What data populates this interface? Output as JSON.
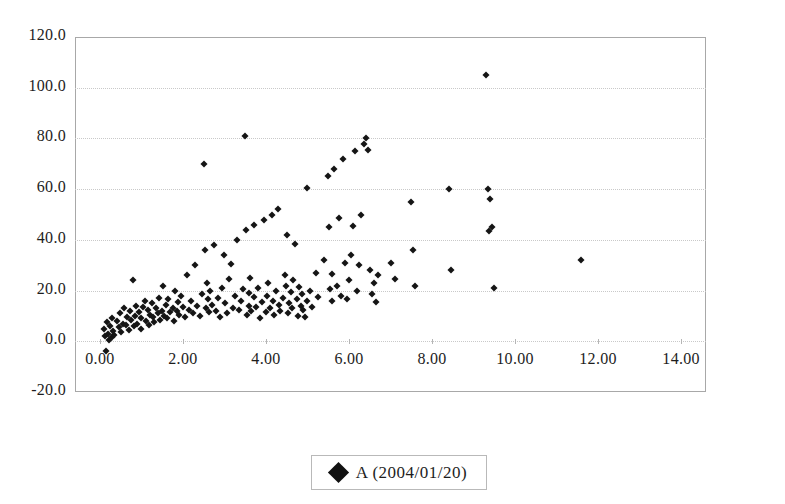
{
  "chart_data": {
    "type": "scatter",
    "title": "",
    "xlabel": "",
    "ylabel": "",
    "xlim": [
      -0.6,
      14.6
    ],
    "ylim": [
      -20.0,
      120.0
    ],
    "grid": true,
    "legend_position": "bottom",
    "x_ticks": [
      "0.00",
      "2.00",
      "4.00",
      "6.00",
      "8.00",
      "10.00",
      "12.00",
      "14.00"
    ],
    "x_tick_values": [
      0,
      2,
      4,
      6,
      8,
      10,
      12,
      14
    ],
    "y_ticks": [
      "120.0",
      "100.0",
      "80.0",
      "60.0",
      "40.0",
      "20.0",
      "0.0",
      "-20.0"
    ],
    "y_tick_values": [
      120,
      100,
      80,
      60,
      40,
      20,
      0,
      -20
    ],
    "marker_color": "#151515",
    "marker_shape": "diamond",
    "series": [
      {
        "name": "A (2004/01/20)",
        "points": [
          [
            0.1,
            5.0
          ],
          [
            0.12,
            2.0
          ],
          [
            0.15,
            -4.0
          ],
          [
            0.18,
            7.5
          ],
          [
            0.2,
            3.0
          ],
          [
            0.22,
            0.5
          ],
          [
            0.25,
            6.0
          ],
          [
            0.28,
            1.5
          ],
          [
            0.3,
            9.0
          ],
          [
            0.32,
            4.0
          ],
          [
            0.35,
            2.5
          ],
          [
            0.4,
            8.0
          ],
          [
            0.45,
            5.5
          ],
          [
            0.48,
            11.0
          ],
          [
            0.5,
            3.5
          ],
          [
            0.55,
            7.0
          ],
          [
            0.58,
            13.0
          ],
          [
            0.62,
            6.5
          ],
          [
            0.65,
            9.5
          ],
          [
            0.7,
            4.5
          ],
          [
            0.72,
            12.0
          ],
          [
            0.75,
            8.5
          ],
          [
            0.8,
            24.0
          ],
          [
            0.82,
            6.0
          ],
          [
            0.85,
            10.0
          ],
          [
            0.88,
            14.0
          ],
          [
            0.9,
            7.0
          ],
          [
            0.95,
            11.5
          ],
          [
            0.98,
            5.0
          ],
          [
            1.0,
            9.0
          ],
          [
            1.05,
            13.5
          ],
          [
            1.08,
            16.0
          ],
          [
            1.1,
            8.0
          ],
          [
            1.15,
            12.5
          ],
          [
            1.18,
            6.5
          ],
          [
            1.2,
            10.5
          ],
          [
            1.25,
            15.0
          ],
          [
            1.28,
            9.5
          ],
          [
            1.3,
            7.5
          ],
          [
            1.35,
            13.0
          ],
          [
            1.4,
            11.0
          ],
          [
            1.42,
            17.0
          ],
          [
            1.45,
            8.5
          ],
          [
            1.5,
            12.0
          ],
          [
            1.52,
            22.0
          ],
          [
            1.55,
            10.0
          ],
          [
            1.6,
            14.5
          ],
          [
            1.62,
            9.0
          ],
          [
            1.65,
            16.5
          ],
          [
            1.7,
            11.5
          ],
          [
            1.75,
            13.0
          ],
          [
            1.78,
            8.0
          ],
          [
            1.8,
            20.0
          ],
          [
            1.85,
            12.0
          ],
          [
            1.88,
            15.5
          ],
          [
            1.9,
            10.5
          ],
          [
            1.95,
            18.0
          ],
          [
            2.0,
            13.5
          ],
          [
            2.05,
            9.5
          ],
          [
            2.1,
            26.0
          ],
          [
            2.15,
            12.5
          ],
          [
            2.2,
            16.0
          ],
          [
            2.25,
            11.0
          ],
          [
            2.3,
            30.0
          ],
          [
            2.35,
            14.0
          ],
          [
            2.4,
            10.0
          ],
          [
            2.45,
            18.5
          ],
          [
            2.5,
            70.0
          ],
          [
            2.52,
            36.0
          ],
          [
            2.55,
            13.0
          ],
          [
            2.58,
            23.0
          ],
          [
            2.6,
            16.5
          ],
          [
            2.62,
            11.5
          ],
          [
            2.65,
            20.0
          ],
          [
            2.7,
            14.5
          ],
          [
            2.75,
            38.0
          ],
          [
            2.8,
            12.0
          ],
          [
            2.85,
            17.0
          ],
          [
            2.9,
            9.5
          ],
          [
            2.95,
            21.0
          ],
          [
            3.0,
            34.0
          ],
          [
            3.02,
            15.0
          ],
          [
            3.05,
            11.0
          ],
          [
            3.1,
            24.5
          ],
          [
            3.15,
            30.5
          ],
          [
            3.2,
            13.0
          ],
          [
            3.25,
            18.0
          ],
          [
            3.3,
            40.0
          ],
          [
            3.35,
            12.5
          ],
          [
            3.4,
            16.0
          ],
          [
            3.45,
            20.5
          ],
          [
            3.5,
            81.0
          ],
          [
            3.52,
            44.0
          ],
          [
            3.55,
            10.5
          ],
          [
            3.58,
            14.0
          ],
          [
            3.6,
            19.0
          ],
          [
            3.62,
            25.0
          ],
          [
            3.65,
            12.0
          ],
          [
            3.7,
            46.0
          ],
          [
            3.72,
            17.5
          ],
          [
            3.75,
            13.5
          ],
          [
            3.8,
            21.0
          ],
          [
            3.85,
            9.0
          ],
          [
            3.9,
            15.5
          ],
          [
            3.95,
            48.0
          ],
          [
            4.0,
            11.5
          ],
          [
            4.02,
            18.0
          ],
          [
            4.05,
            23.0
          ],
          [
            4.1,
            13.0
          ],
          [
            4.15,
            50.0
          ],
          [
            4.18,
            16.0
          ],
          [
            4.2,
            10.5
          ],
          [
            4.25,
            20.0
          ],
          [
            4.3,
            52.0
          ],
          [
            4.32,
            14.5
          ],
          [
            4.35,
            12.0
          ],
          [
            4.4,
            17.0
          ],
          [
            4.45,
            26.0
          ],
          [
            4.48,
            22.0
          ],
          [
            4.5,
            42.0
          ],
          [
            4.52,
            11.0
          ],
          [
            4.55,
            15.0
          ],
          [
            4.6,
            19.5
          ],
          [
            4.62,
            13.0
          ],
          [
            4.65,
            24.0
          ],
          [
            4.7,
            38.5
          ],
          [
            4.75,
            16.5
          ],
          [
            4.78,
            10.0
          ],
          [
            4.8,
            21.5
          ],
          [
            4.85,
            14.0
          ],
          [
            4.88,
            18.5
          ],
          [
            4.9,
            12.5
          ],
          [
            4.95,
            9.5
          ],
          [
            4.98,
            16.0
          ],
          [
            5.0,
            60.5
          ],
          [
            5.05,
            20.0
          ],
          [
            5.1,
            13.5
          ],
          [
            5.2,
            27.0
          ],
          [
            5.25,
            17.5
          ],
          [
            5.4,
            32.0
          ],
          [
            5.5,
            65.0
          ],
          [
            5.52,
            45.0
          ],
          [
            5.55,
            20.5
          ],
          [
            5.58,
            16.0
          ],
          [
            5.6,
            26.5
          ],
          [
            5.65,
            68.0
          ],
          [
            5.7,
            22.0
          ],
          [
            5.75,
            48.5
          ],
          [
            5.8,
            18.0
          ],
          [
            5.85,
            72.0
          ],
          [
            5.9,
            31.0
          ],
          [
            5.95,
            16.5
          ],
          [
            6.0,
            24.0
          ],
          [
            6.05,
            34.0
          ],
          [
            6.1,
            45.5
          ],
          [
            6.15,
            75.0
          ],
          [
            6.2,
            20.0
          ],
          [
            6.25,
            30.0
          ],
          [
            6.3,
            50.0
          ],
          [
            6.35,
            78.0
          ],
          [
            6.4,
            80.0
          ],
          [
            6.45,
            75.5
          ],
          [
            6.5,
            28.0
          ],
          [
            6.55,
            18.5
          ],
          [
            6.6,
            23.0
          ],
          [
            6.65,
            15.5
          ],
          [
            6.7,
            26.0
          ],
          [
            7.0,
            31.0
          ],
          [
            7.1,
            24.5
          ],
          [
            7.5,
            55.0
          ],
          [
            7.55,
            36.0
          ],
          [
            7.6,
            22.0
          ],
          [
            8.4,
            60.0
          ],
          [
            8.45,
            28.0
          ],
          [
            9.3,
            105.0
          ],
          [
            9.35,
            60.0
          ],
          [
            9.38,
            43.5
          ],
          [
            9.4,
            56.0
          ],
          [
            9.45,
            45.0
          ],
          [
            9.5,
            21.0
          ],
          [
            11.6,
            32.0
          ]
        ]
      }
    ]
  },
  "legend": {
    "entries": [
      {
        "label": "A (2004/01/20)",
        "marker": "diamond-marker",
        "color": "#111111"
      }
    ]
  }
}
